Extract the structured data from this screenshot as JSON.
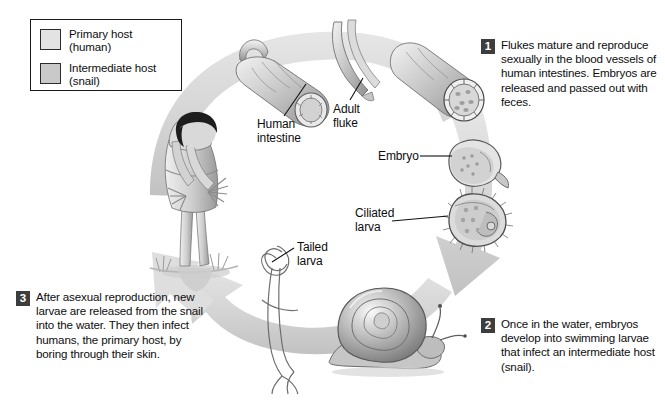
{
  "diagram": {
    "background_color": "#ffffff",
    "arrow_color": "#d6d6d6",
    "ink_color": "#0d0d0d"
  },
  "legend": {
    "items": [
      {
        "label_line1": "Primary host",
        "label_line2": "(human)",
        "swatch_color": "#e3e3e3",
        "swatch_name": "primary-host-swatch"
      },
      {
        "label_line1": "Intermediate host",
        "label_line2": "(snail)",
        "swatch_color": "#c9c9c9",
        "swatch_name": "intermediate-host-swatch"
      }
    ]
  },
  "steps": [
    {
      "number": "1",
      "text": "Flukes mature and reproduce sexually in the blood vessels of human intestines. Embryos are released and passed out with feces.",
      "badge_color": "#3d3d3d"
    },
    {
      "number": "2",
      "text": "Once in the water, embryos develop into swimming larvae that infect an intermediate host (snail).",
      "badge_color": "#3d3d3d"
    },
    {
      "number": "3",
      "text": "After asexual reproduction, new larvae are released from the snail into the water. They then infect humans, the primary host, by boring through their skin.",
      "badge_color": "#3d3d3d"
    }
  ],
  "callouts": [
    {
      "name": "human-intestine",
      "line1": "Human",
      "line2": "intestine"
    },
    {
      "name": "adult-fluke",
      "line1": "Adult",
      "line2": "fluke"
    },
    {
      "name": "embryo",
      "line1": "Embryo",
      "line2": ""
    },
    {
      "name": "ciliated-larva",
      "line1": "Ciliated",
      "line2": "larva"
    },
    {
      "name": "tailed-larva",
      "line1": "Tailed",
      "line2": "larva"
    }
  ],
  "illustrations": [
    {
      "name": "human-figure",
      "description": "woman bending over working in flooded field"
    },
    {
      "name": "intestine-segment-left",
      "description": "cut intestine segment with flukes"
    },
    {
      "name": "adult-fluke-pair",
      "description": "paired adult flukes"
    },
    {
      "name": "intestine-segment-right",
      "description": "intestine cross-section with embryos"
    },
    {
      "name": "embryo-egg",
      "description": "oval embryo egg with spots"
    },
    {
      "name": "ciliated-larva-body",
      "description": "ciliated swimming larva (miracidium)"
    },
    {
      "name": "snail",
      "description": "snail intermediate host"
    },
    {
      "name": "tailed-larva-body",
      "description": "fork-tailed larvae (cercariae)"
    }
  ]
}
